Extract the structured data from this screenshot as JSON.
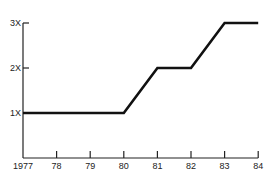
{
  "chart_data": {
    "type": "line",
    "title": "",
    "xlabel": "",
    "ylabel": "",
    "categories": [
      "1977",
      "78",
      "79",
      "80",
      "81",
      "82",
      "83",
      "84"
    ],
    "x": [
      1977,
      1978,
      1979,
      1980,
      1981,
      1982,
      1983,
      1984
    ],
    "series": [
      {
        "name": "",
        "values": [
          1,
          1,
          1,
          1,
          2,
          2,
          3,
          3
        ]
      }
    ],
    "y_ticks": [
      "1X",
      "2X",
      "3X"
    ],
    "y_tick_values": [
      1,
      2,
      3
    ],
    "ylim": [
      0,
      3
    ],
    "xlim": [
      1977,
      1984
    ],
    "grid": false,
    "legend": "none",
    "line_color": "#111111",
    "axis_color": "#222222"
  }
}
